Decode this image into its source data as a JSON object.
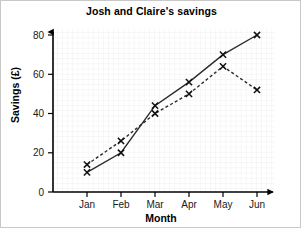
{
  "chart_data": {
    "type": "line",
    "title": "Josh and Claire's savings",
    "xlabel": "Month",
    "ylabel": "Savings (£)",
    "categories": [
      "Jan",
      "Feb",
      "Mar",
      "Apr",
      "May",
      "Jun"
    ],
    "ylim": [
      0,
      85
    ],
    "yticks": [
      0,
      20,
      40,
      60,
      80
    ],
    "ytick_labels": [
      "0",
      "20",
      "40",
      "60",
      "80"
    ],
    "grid": true,
    "legend": false,
    "marker": "x",
    "series": [
      {
        "name": "solid-series",
        "values": [
          10,
          20,
          44,
          56,
          70,
          80
        ],
        "style": "solid",
        "color": "#2b2b2b"
      },
      {
        "name": "dashed-series",
        "values": [
          14,
          26,
          40,
          50,
          64,
          52
        ],
        "style": "dashed",
        "color": "#2b2b2b"
      }
    ]
  },
  "colors": {
    "axis": "#000000",
    "grid_minor": "#ececec",
    "grid_major": "#e0e0e0",
    "background": "#ffffff",
    "border": "#c8c8c8"
  }
}
